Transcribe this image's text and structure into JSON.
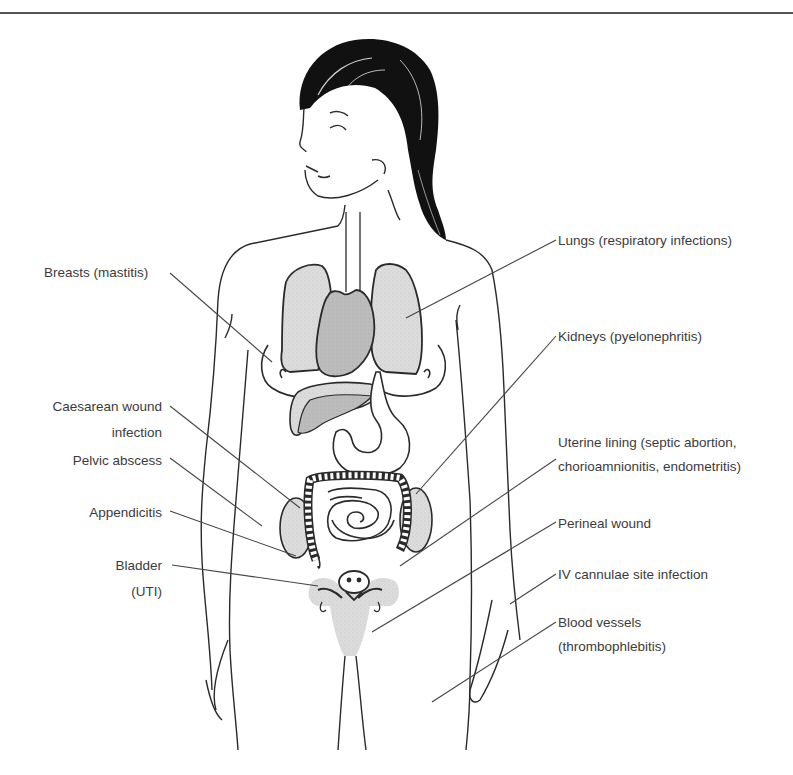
{
  "figure": {
    "colors": {
      "line": "#2a2a2a",
      "hair": "#111111",
      "organ_light": "#d9d9d9",
      "organ_mid": "#bdbdbd",
      "organ_dark": "#9e9e9e",
      "leader": "#444444",
      "text": "#3b3b3b"
    }
  },
  "labels": {
    "left": [
      {
        "id": "breasts",
        "lines": [
          "Breasts (mastitis)"
        ]
      },
      {
        "id": "caesarean",
        "lines": [
          "Caesarean wound",
          "infection"
        ]
      },
      {
        "id": "pelvic",
        "lines": [
          "Pelvic abscess"
        ]
      },
      {
        "id": "appendicitis",
        "lines": [
          "Appendicitis"
        ]
      },
      {
        "id": "bladder",
        "lines": [
          "Bladder",
          "(UTI)"
        ]
      }
    ],
    "right": [
      {
        "id": "lungs",
        "lines": [
          "Lungs (respiratory infections)"
        ]
      },
      {
        "id": "kidneys",
        "lines": [
          "Kidneys (pyelonephritis)"
        ]
      },
      {
        "id": "uterine",
        "lines": [
          "Uterine lining (septic abortion,",
          "chorioamnionitis, endometritis)"
        ]
      },
      {
        "id": "perineal",
        "lines": [
          "Perineal wound"
        ]
      },
      {
        "id": "iv",
        "lines": [
          "IV cannulae site infection"
        ]
      },
      {
        "id": "blood",
        "lines": [
          "Blood vessels",
          "(thrombophlebitis)"
        ]
      }
    ]
  }
}
